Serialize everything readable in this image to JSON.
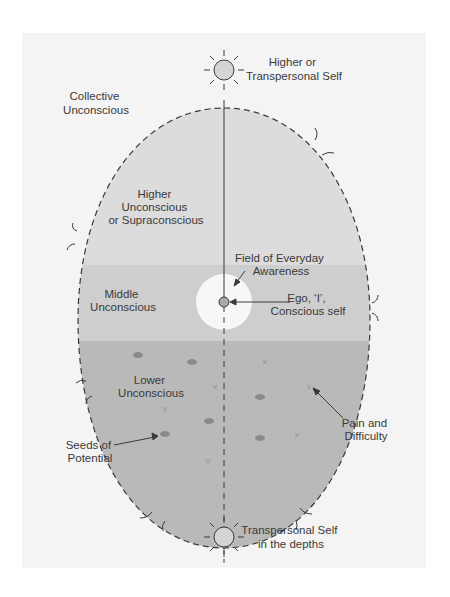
{
  "diagram": {
    "labels": {
      "higher_self": [
        "Higher or",
        "Transpersonal Self"
      ],
      "collective": [
        "Collective",
        "Unconscious"
      ],
      "higher_unconscious": [
        "Higher",
        "Unconscious",
        "or Supraconscious"
      ],
      "field_awareness": [
        "Field of Everyday",
        "Awareness"
      ],
      "middle_unconscious": [
        "Middle",
        "Unconscious"
      ],
      "ego": [
        "Ego, ‘I’,",
        "Conscious self"
      ],
      "lower_unconscious": [
        "Lower",
        "Unconscious"
      ],
      "seeds": [
        "Seeds of",
        "Potential"
      ],
      "pain": [
        "Pain and",
        "Difficulty"
      ],
      "lower_self": [
        "Transpersonal Self",
        "in the depths"
      ]
    },
    "colors": {
      "panel": "#f4f4f4",
      "higher": "#dcdcdc",
      "middle": "#cecece",
      "lower": "#b9b9b9",
      "field": "#f7f7f7",
      "seed": "#8a8a8a",
      "cross": "#9a9a9a",
      "stroke": "#3a3a3a"
    },
    "icons": [
      "sun-icon-top",
      "sun-icon-bottom",
      "ego-circle-icon",
      "seed-icon",
      "cross-icon"
    ]
  }
}
